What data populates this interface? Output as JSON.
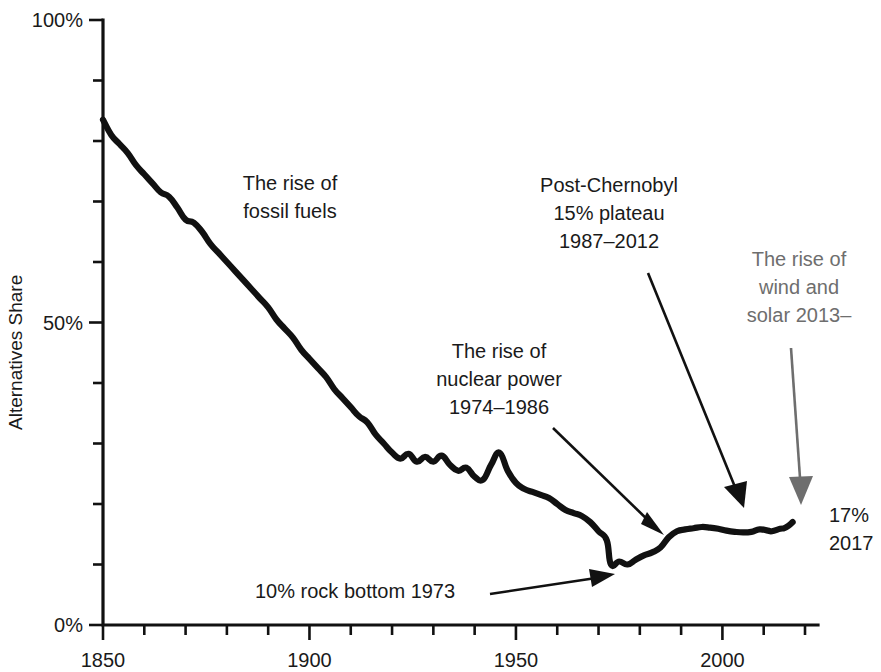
{
  "chart_data": {
    "type": "line",
    "title": "",
    "xlabel": "",
    "ylabel": "Alternatives Share",
    "xlim": [
      1850,
      2020
    ],
    "ylim": [
      0,
      100
    ],
    "grid": false,
    "legend": "none",
    "x_tick_labels": [
      "1850",
      "1900",
      "1950",
      "2000"
    ],
    "x_tick_values": [
      1850,
      1900,
      1950,
      2000
    ],
    "x_minor_step": 10,
    "y_tick_labels": [
      "0%",
      "50%",
      "100%"
    ],
    "y_tick_values": [
      0,
      50,
      100
    ],
    "y_minor_step": 10,
    "series": [
      {
        "name": "Alternatives Share",
        "color": "#111111",
        "x": [
          1850,
          1852,
          1854,
          1856,
          1858,
          1860,
          1862,
          1864,
          1866,
          1868,
          1870,
          1872,
          1874,
          1876,
          1878,
          1880,
          1882,
          1884,
          1886,
          1888,
          1890,
          1892,
          1894,
          1896,
          1898,
          1900,
          1902,
          1904,
          1906,
          1908,
          1910,
          1912,
          1914,
          1916,
          1918,
          1920,
          1922,
          1924,
          1926,
          1928,
          1930,
          1932,
          1934,
          1936,
          1938,
          1940,
          1942,
          1944,
          1946,
          1948,
          1950,
          1952,
          1954,
          1956,
          1958,
          1960,
          1962,
          1964,
          1966,
          1968,
          1970,
          1972,
          1973,
          1975,
          1977,
          1979,
          1981,
          1983,
          1985,
          1987,
          1989,
          1991,
          1993,
          1995,
          1997,
          1999,
          2001,
          2003,
          2005,
          2007,
          2009,
          2011,
          2012,
          2014,
          2015,
          2016,
          2017
        ],
        "y": [
          83.5,
          81.0,
          79.5,
          78.0,
          76.0,
          74.5,
          73.0,
          71.5,
          70.8,
          69.0,
          67.0,
          66.5,
          65.0,
          63.0,
          61.5,
          60.0,
          58.5,
          57.0,
          55.5,
          54.0,
          52.5,
          50.5,
          49.0,
          47.5,
          45.5,
          44.0,
          42.5,
          41.0,
          39.0,
          37.5,
          36.0,
          34.5,
          33.5,
          31.5,
          30.0,
          28.5,
          27.5,
          28.3,
          27.0,
          27.8,
          27.0,
          28.0,
          26.5,
          25.5,
          26.0,
          24.5,
          24.0,
          26.5,
          28.5,
          25.5,
          23.5,
          22.5,
          22.0,
          21.5,
          21.0,
          20.0,
          19.0,
          18.5,
          18.0,
          17.0,
          15.5,
          14.0,
          10.0,
          10.5,
          10.0,
          10.8,
          11.5,
          12.0,
          12.8,
          14.5,
          15.5,
          15.8,
          16.0,
          16.2,
          16.1,
          15.9,
          15.6,
          15.4,
          15.3,
          15.4,
          15.8,
          15.6,
          15.5,
          15.9,
          16.0,
          16.4,
          17.0
        ]
      }
    ],
    "annotations": [
      {
        "id": "fossil-fuels",
        "lines": [
          "The rise of",
          "fossil fuels"
        ],
        "color": "#1a1a1a",
        "has_arrow": false
      },
      {
        "id": "nuclear-power",
        "lines": [
          "The rise of",
          "nuclear power",
          "1974–1986"
        ],
        "color": "#1a1a1a",
        "has_arrow": true
      },
      {
        "id": "post-chernobyl",
        "lines": [
          "Post-Chernobyl",
          "15% plateau",
          "1987–2012"
        ],
        "color": "#1a1a1a",
        "has_arrow": true
      },
      {
        "id": "wind-solar",
        "lines": [
          "The rise of",
          "wind and",
          "solar 2013–"
        ],
        "color": "#6e6e6e",
        "has_arrow": true
      },
      {
        "id": "rock-bottom",
        "lines": [
          "10% rock bottom 1973"
        ],
        "color": "#1a1a1a",
        "has_arrow": true
      }
    ],
    "endpoint_label": {
      "value": "17%",
      "year": "2017"
    }
  }
}
